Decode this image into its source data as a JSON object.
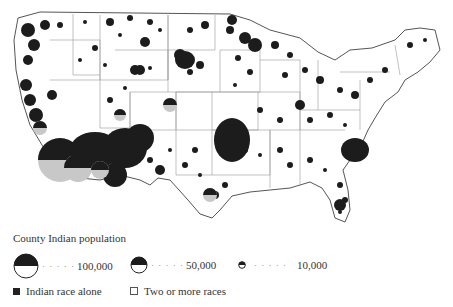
{
  "map": {
    "type": "proportional-symbol",
    "region": "Contiguous United States (county level)",
    "colors": {
      "alone": "#1c1c1c",
      "multi": "#c8c8c8",
      "outline": "#555555",
      "background": "#ffffff"
    }
  },
  "legend": {
    "title": "County Indian population",
    "sizes": [
      {
        "value": "100,000",
        "dots": "· · · · ·"
      },
      {
        "value": "50,000",
        "dots": "· · · · ·"
      },
      {
        "value": "10,000",
        "dots": "· · · · ·"
      }
    ],
    "categories": [
      {
        "label": "Indian race alone",
        "swatch": "dark"
      },
      {
        "label": "Two or more races",
        "swatch": "light"
      }
    ]
  }
}
